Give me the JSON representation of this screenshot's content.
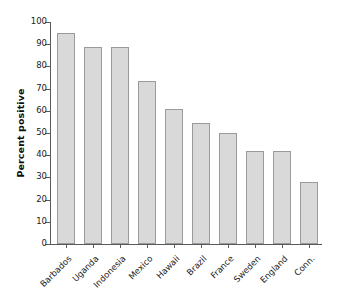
{
  "chart_data": {
    "type": "bar",
    "title": "",
    "subtitle": "",
    "xlabel": "",
    "ylabel": "Percent positive",
    "categories": [
      "Barbados",
      "Uganda",
      "Indonesia",
      "Mexico",
      "Hawaii",
      "Brazil",
      "France",
      "Sweden",
      "England",
      "Conn."
    ],
    "values": [
      95,
      88.8,
      88.6,
      73.6,
      61,
      54.6,
      50,
      42,
      42,
      28
    ],
    "ylim": [
      0,
      100
    ],
    "ytick_labels": [
      "0",
      "10",
      "20",
      "30",
      "40",
      "50",
      "60",
      "70",
      "80",
      "90",
      "100"
    ],
    "ytick_values": [
      0,
      10,
      20,
      30,
      40,
      50,
      60,
      70,
      80,
      90,
      100
    ],
    "grid": false,
    "legend": false,
    "legend_position": "none",
    "bar_fill_color": "#d9d9d9",
    "bar_edge_color": "#9a9a9a",
    "axis_color": "#5a5a5a",
    "background_color": "#ffffff",
    "xlabel_rotation_deg": 45
  }
}
